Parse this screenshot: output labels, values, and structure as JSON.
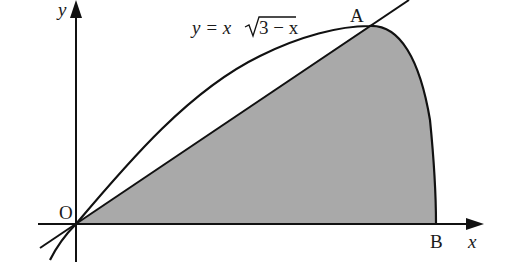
{
  "diagram": {
    "type": "area-between-curves",
    "equation_label": "y = x√(3 − x)",
    "equation_parts": {
      "lhs": "y = x",
      "radicand": "3 − x"
    },
    "labels": {
      "origin": "O",
      "point_a": "A",
      "point_b": "B",
      "x_axis": "x",
      "y_axis": "y"
    },
    "note": "Curve and line drawn to match observed pixel positions, not computed from the labelled equation; the labelled y = x√(3−x) peaks at x = 2, which does not correspond to A's position in the source image.",
    "points_px": {
      "origin": [
        76,
        224
      ],
      "a": [
        369,
        26
      ],
      "b": [
        436,
        224
      ]
    },
    "colors": {
      "stroke": "#111111",
      "shade": "#a9a9a9",
      "background": "#ffffff"
    }
  }
}
